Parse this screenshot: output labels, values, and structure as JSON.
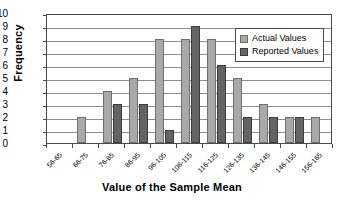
{
  "chart_data": {
    "type": "bar",
    "title": "",
    "xlabel": "Value of the Sample Mean",
    "ylabel": "Frequency",
    "ylim": [
      0,
      10
    ],
    "ytick_step": 1,
    "yticks": [
      "10",
      "9",
      "8",
      "7",
      "6",
      "5",
      "4",
      "3",
      "2",
      "1",
      "0"
    ],
    "grid": "horizontal",
    "legend_position": "top-right",
    "categories": [
      "56-65",
      "66-75",
      "76-85",
      "86-95",
      "96-105",
      "106-115",
      "116-125",
      "126-135",
      "136-145",
      "146-155",
      "156-165"
    ],
    "series": [
      {
        "name": "Actual Values",
        "color": "#a9a9a9",
        "values": [
          0,
          2,
          4,
          5,
          8,
          8,
          8,
          5,
          3,
          2,
          2
        ]
      },
      {
        "name": "Reported Values",
        "color": "#636363",
        "values": [
          0,
          0,
          3,
          3,
          1,
          9,
          6,
          2,
          2,
          2,
          0
        ]
      }
    ]
  },
  "legend": {
    "items": [
      {
        "label": "Actual Values"
      },
      {
        "label": "Reported Values"
      }
    ]
  }
}
